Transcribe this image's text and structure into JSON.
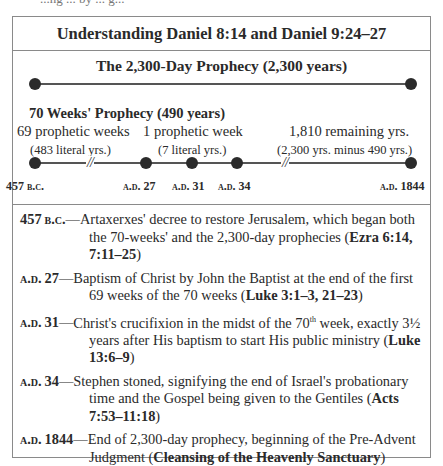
{
  "top_fragment": "...ng ... by ... g...",
  "title": "Understanding Daniel 8:14 and Daniel 9:24–27",
  "timeline": {
    "main_title": "The 2,300-Day Prophecy (2,300 years)",
    "seventy_weeks_title": "70 Weeks' Prophecy (490 years)",
    "segments": [
      {
        "label": "69 prophetic weeks",
        "sub": "(483 literal yrs.)"
      },
      {
        "label": "1 prophetic week",
        "sub": "(7 literal yrs.)"
      },
      {
        "label": "1,810 remaining yrs.",
        "sub": "(2,300 yrs. minus 490 yrs.)"
      }
    ],
    "points": [
      {
        "year": "457",
        "era": "B.C.",
        "era_first": true
      },
      {
        "year": "27",
        "era": "A.D.",
        "era_first": true
      },
      {
        "year": "31",
        "era": "A.D.",
        "era_first": true
      },
      {
        "year": "34",
        "era": "A.D.",
        "era_first": true
      },
      {
        "year": "1844",
        "era": "A.D.",
        "era_first": true
      }
    ],
    "break_mark": "//"
  },
  "notes": [
    {
      "date_num": "457",
      "date_era": "B.C.",
      "era_first": false,
      "text": "Artaxerxes' decree to restore Jerusalem, which began both the 70-weeks' and the 2,300-day prophecies (",
      "ref": "Ezra 6:14, 7:11–25",
      "after": ")"
    },
    {
      "date_num": "27",
      "date_era": "A.D.",
      "era_first": true,
      "text": "Baptism of Christ by John the Baptist at the end of the first 69 weeks of the 70 weeks (",
      "ref": "Luke 3:1–3, 21–23",
      "after": ")"
    },
    {
      "date_num": "31",
      "date_era": "A.D.",
      "era_first": true,
      "text_a": "Christ's crucifixion in the midst of the 70",
      "sup": "th",
      "text_b": " week, exactly 3½ years after His baptism to start His public ministry (",
      "ref": "Luke 13:6–9",
      "after": ")"
    },
    {
      "date_num": "34",
      "date_era": "A.D.",
      "era_first": true,
      "text": "Stephen stoned, signifying the end of Israel's probationary time and the Gospel being given to the Gentiles (",
      "ref": "Acts 7:53–11:18",
      "after": ")"
    },
    {
      "date_num": "1844",
      "date_era": "A.D.",
      "era_first": true,
      "text": "End of 2,300-day prophecy, beginning of the Pre-Advent Judgment (",
      "ref": "Cleansing of the Heavenly Sanctuary",
      "after": ")"
    }
  ],
  "dash": "—",
  "colors": {
    "border": "#8a8a8a",
    "text": "#2a2a2a",
    "dot": "#2b2b2b"
  }
}
